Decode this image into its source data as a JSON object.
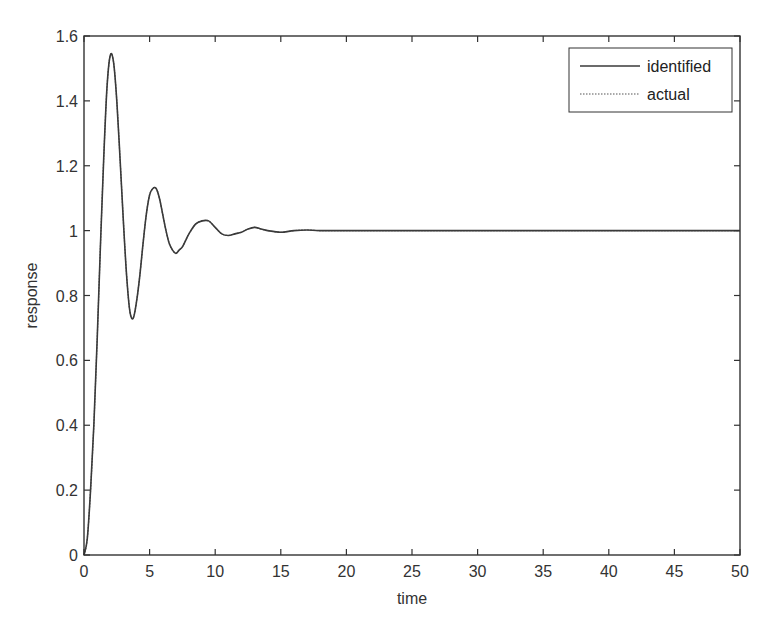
{
  "chart_data": {
    "type": "line",
    "title": "",
    "xlabel": "time",
    "ylabel": "response",
    "xlim": [
      0,
      50
    ],
    "ylim": [
      0,
      1.6
    ],
    "xticks": [
      0,
      5,
      10,
      15,
      20,
      25,
      30,
      35,
      40,
      45,
      50
    ],
    "xtick_labels": [
      "0",
      "5",
      "10",
      "15",
      "20",
      "25",
      "30",
      "35",
      "40",
      "45",
      "50"
    ],
    "yticks": [
      0,
      0.2,
      0.4,
      0.6,
      0.8,
      1.0,
      1.2,
      1.4,
      1.6
    ],
    "ytick_labels": [
      "0",
      "0.2",
      "0.4",
      "0.6",
      "0.8",
      "1",
      "1.2",
      "1.4",
      "1.6"
    ],
    "grid": false,
    "legend_position": "upper right",
    "x": [
      0,
      0.25,
      0.5,
      0.75,
      1.0,
      1.25,
      1.5,
      1.75,
      2.0,
      2.25,
      2.5,
      2.75,
      3.0,
      3.25,
      3.5,
      3.75,
      4.0,
      4.25,
      4.5,
      4.75,
      5.0,
      5.25,
      5.5,
      5.75,
      6.0,
      6.25,
      6.5,
      6.75,
      7.0,
      7.25,
      7.5,
      7.75,
      8.0,
      8.5,
      9.0,
      9.5,
      10.0,
      10.5,
      11.0,
      11.5,
      12.0,
      12.5,
      13.0,
      13.5,
      14.0,
      15.0,
      16.0,
      17.0,
      18.0,
      20.0,
      25.0,
      30.0,
      35.0,
      40.0,
      45.0,
      50.0
    ],
    "series": [
      {
        "name": "identified",
        "style": "solid",
        "values": [
          0,
          0.05,
          0.2,
          0.4,
          0.66,
          0.95,
          1.22,
          1.44,
          1.54,
          1.52,
          1.4,
          1.22,
          1.03,
          0.86,
          0.75,
          0.73,
          0.78,
          0.86,
          0.96,
          1.05,
          1.11,
          1.13,
          1.13,
          1.1,
          1.05,
          1.0,
          0.96,
          0.94,
          0.93,
          0.94,
          0.95,
          0.97,
          0.99,
          1.02,
          1.03,
          1.03,
          1.01,
          0.99,
          0.985,
          0.99,
          0.995,
          1.005,
          1.01,
          1.005,
          1.0,
          0.995,
          1.0,
          1.002,
          1.0,
          1.0,
          1.0,
          1.0,
          1.0,
          1.0,
          1.0,
          1.0
        ]
      },
      {
        "name": "actual",
        "style": "dotted",
        "values": [
          0,
          0.05,
          0.2,
          0.4,
          0.66,
          0.95,
          1.22,
          1.44,
          1.54,
          1.52,
          1.4,
          1.22,
          1.03,
          0.86,
          0.75,
          0.73,
          0.78,
          0.86,
          0.96,
          1.05,
          1.11,
          1.13,
          1.13,
          1.1,
          1.05,
          1.0,
          0.96,
          0.94,
          0.93,
          0.94,
          0.95,
          0.97,
          0.99,
          1.02,
          1.03,
          1.03,
          1.01,
          0.99,
          0.985,
          0.99,
          0.995,
          1.005,
          1.01,
          1.005,
          1.0,
          0.995,
          1.0,
          1.002,
          1.0,
          1.0,
          1.0,
          1.0,
          1.0,
          1.0,
          1.0,
          1.0
        ]
      }
    ],
    "colors": {
      "line": "#3a3a3a",
      "axis": "#333333",
      "background": "#ffffff"
    }
  },
  "legend": {
    "items": [
      {
        "label": "identified",
        "style": "solid"
      },
      {
        "label": "actual",
        "style": "dotted"
      }
    ]
  },
  "axes": {
    "xlabel": "time",
    "ylabel": "response"
  }
}
